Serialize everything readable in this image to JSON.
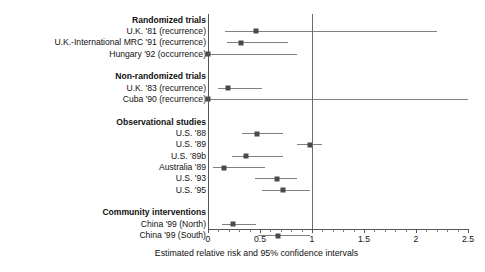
{
  "chart_data": {
    "type": "scatter",
    "subtype": "forest-plot",
    "title": "",
    "xlabel": "Estimated relative risk and 95% confidence intervals",
    "ylabel": "",
    "xlim": [
      0,
      2.5
    ],
    "xticks": [
      0,
      0.5,
      1,
      1.5,
      2,
      2.5
    ],
    "xticklabels": [
      "0",
      "0.5",
      "1",
      "1.5",
      "2",
      "2.5"
    ],
    "grid": false,
    "legend": null,
    "reference_line": 1,
    "groups": [
      {
        "name": "Randomized trials",
        "rows": [
          {
            "label": "U.K. '81 (recurrence)",
            "estimate": 0.46,
            "ci_low": 0.16,
            "ci_high": 2.2
          },
          {
            "label": "U.K.-International MRC '91 (recurrence)",
            "estimate": 0.32,
            "ci_low": 0.18,
            "ci_high": 0.77
          },
          {
            "label": "Hungary '92 (occurrence)",
            "estimate": 0.0,
            "ci_low": 0.0,
            "ci_high": 0.86
          }
        ]
      },
      {
        "name": "Non-randomized trials",
        "rows": [
          {
            "label": "U.K. '83 (recurrence)",
            "estimate": 0.19,
            "ci_low": 0.1,
            "ci_high": 0.52
          },
          {
            "label": "Cuba '90 (recurrence)",
            "estimate": 0.0,
            "ci_low": 0.0,
            "ci_high": 2.5
          }
        ]
      },
      {
        "name": "Observational studies",
        "rows": [
          {
            "label": "U.S. '88",
            "estimate": 0.47,
            "ci_low": 0.33,
            "ci_high": 0.72
          },
          {
            "label": "U.S. '89",
            "estimate": 0.98,
            "ci_low": 0.86,
            "ci_high": 1.1
          },
          {
            "label": "U.S. '89b",
            "estimate": 0.37,
            "ci_low": 0.23,
            "ci_high": 0.72
          },
          {
            "label": "Australia '89",
            "estimate": 0.15,
            "ci_low": 0.05,
            "ci_high": 0.55
          },
          {
            "label": "U.S. '93",
            "estimate": 0.66,
            "ci_low": 0.45,
            "ci_high": 0.86
          },
          {
            "label": "U.S. '95",
            "estimate": 0.72,
            "ci_low": 0.52,
            "ci_high": 0.98
          }
        ]
      },
      {
        "name": "Community interventions",
        "rows": [
          {
            "label": "China '99 (North)",
            "estimate": 0.24,
            "ci_low": 0.13,
            "ci_high": 0.46
          },
          {
            "label": "China '99 (South)",
            "estimate": 0.67,
            "ci_low": 0.48,
            "ci_high": 0.98
          }
        ]
      }
    ]
  }
}
